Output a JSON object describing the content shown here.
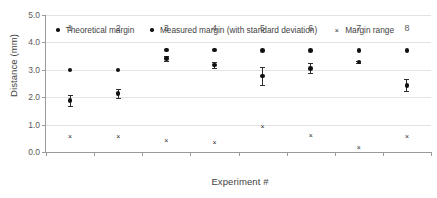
{
  "chart_data": {
    "type": "scatter",
    "title": "",
    "xlabel": "Experiment #",
    "ylabel": "Distance (mm)",
    "categories": [
      "1",
      "2",
      "3",
      "4",
      "5",
      "6",
      "7",
      "8"
    ],
    "x": [
      1,
      2,
      3,
      4,
      5,
      6,
      7,
      8
    ],
    "xlim": [
      0.5,
      8.5
    ],
    "ylim": [
      0.0,
      5.0
    ],
    "y_ticks": [
      "0.0",
      "1.0",
      "2.0",
      "3.0",
      "4.0",
      "5.0"
    ],
    "y_tick_values": [
      0.0,
      1.0,
      2.0,
      3.0,
      4.0,
      5.0
    ],
    "grid": "horizontal",
    "legend_position": "top-inside",
    "series": [
      {
        "name": "Theoretical margin",
        "marker": "dot",
        "values": [
          3.0,
          3.0,
          3.72,
          3.72,
          3.71,
          3.71,
          3.71,
          3.7
        ]
      },
      {
        "name": "Measured margin (with standard deviation)",
        "marker": "dot-errorbar",
        "values": [
          1.89,
          2.14,
          3.42,
          3.17,
          2.78,
          3.05,
          3.28,
          2.43
        ],
        "errors": [
          0.2,
          0.16,
          0.1,
          0.11,
          0.33,
          0.18,
          0.05,
          0.22
        ]
      },
      {
        "name": "Margin range",
        "marker": "x",
        "values": [
          0.55,
          0.58,
          0.42,
          0.35,
          0.92,
          0.62,
          0.15,
          0.58
        ]
      }
    ]
  },
  "legend": {
    "items": [
      {
        "label": "Theoretical margin",
        "marker": "dot"
      },
      {
        "label": "Measured margin (with standard deviation)",
        "marker": "dot"
      },
      {
        "label": "Margin range",
        "marker": "x"
      }
    ]
  },
  "glyphs": {
    "cross": "×"
  }
}
